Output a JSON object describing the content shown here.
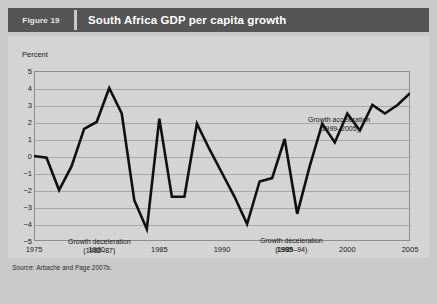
{
  "header": {
    "figure_tag": "Figure 19",
    "title": "South Africa GDP per capita growth"
  },
  "source": {
    "label": "Source:",
    "text": "Arbache and Page 2007b."
  },
  "annotations": {
    "deceleration_1": {
      "line1": "Growth deceleration",
      "line2": "(1982–87)"
    },
    "deceleration_2": {
      "line1": "Growth deceleration",
      "line2": "(1989–94)"
    },
    "acceleration": {
      "line1": "Growth acceleration",
      "line2": "(1999–2005)"
    }
  },
  "colors": {
    "card_background": "#c9c9c9",
    "panel_background": "#d4d4d4",
    "header_bar": "#555555",
    "series_line": "#101010",
    "gridline": "#a8a8a8",
    "frame": "#8e8e8e"
  },
  "chart_data": {
    "type": "line",
    "title": "South Africa GDP per capita growth",
    "xlabel": "",
    "ylabel": "Percent",
    "ylim": [
      -5,
      5
    ],
    "xlim": [
      1975,
      2005
    ],
    "grid": true,
    "legend": false,
    "yticks": [
      5,
      4,
      3,
      2,
      1,
      0,
      -1,
      -2,
      -3,
      -4,
      -5
    ],
    "ytick_labels": [
      "5",
      "4",
      "3",
      "2",
      "1",
      "0",
      "−1",
      "−2",
      "−3",
      "−4",
      "−5"
    ],
    "xticks": [
      1975,
      1980,
      1985,
      1990,
      1995,
      2000,
      2005
    ],
    "xtick_labels": [
      "1975",
      "1980",
      "1985",
      "1990",
      "1995",
      "2000",
      "2005"
    ],
    "x": [
      1975,
      1976,
      1977,
      1978,
      1979,
      1980,
      1981,
      1982,
      1983,
      1984,
      1985,
      1986,
      1987,
      1988,
      1989,
      1990,
      1991,
      1992,
      1993,
      1994,
      1995,
      1996,
      1997,
      1998,
      1999,
      2000,
      2001,
      2002,
      2003,
      2004,
      2005
    ],
    "values": [
      0.0,
      -0.1,
      -2.0,
      -0.6,
      1.6,
      2.0,
      4.0,
      2.5,
      -2.6,
      -4.3,
      2.2,
      -2.4,
      -2.4,
      1.9,
      0.4,
      -1.0,
      -2.4,
      -4.0,
      -1.5,
      -1.3,
      1.0,
      -3.4,
      -0.6,
      1.9,
      0.8,
      2.5,
      1.5,
      3.0,
      2.5,
      3.0,
      3.7
    ],
    "series": [
      {
        "name": "GDP per capita growth",
        "values": [
          0.0,
          -0.1,
          -2.0,
          -0.6,
          1.6,
          2.0,
          4.0,
          2.5,
          -2.6,
          -4.3,
          2.2,
          -2.4,
          -2.4,
          1.9,
          0.4,
          -1.0,
          -2.4,
          -4.0,
          -1.5,
          -1.3,
          1.0,
          -3.4,
          -0.6,
          1.9,
          0.8,
          2.5,
          1.5,
          3.0,
          2.5,
          3.0,
          3.7
        ]
      }
    ],
    "annotations": [
      {
        "text": "Growth deceleration (1982–87)",
        "period": [
          1982,
          1987
        ]
      },
      {
        "text": "Growth deceleration (1989–94)",
        "period": [
          1989,
          1994
        ]
      },
      {
        "text": "Growth acceleration (1999–2005)",
        "period": [
          1999,
          2005
        ]
      }
    ]
  }
}
